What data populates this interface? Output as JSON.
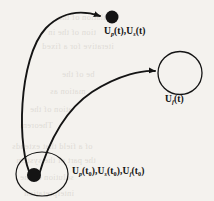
{
  "figure": {
    "caption_absent": true,
    "background_color": "#f4f2ee",
    "ink_color": "#141414",
    "media": "scanned-page"
  },
  "nodes": {
    "initial_state": {
      "name": "initial-state-ellipse",
      "shape": "ellipse",
      "filled_marker": true,
      "cx": 42,
      "cy": 174,
      "rx": 26,
      "ry": 22,
      "dot_cx": 34,
      "dot_cy": 175,
      "dot_r": 7
    },
    "final_state_top": {
      "name": "final-state-dot",
      "shape": "filled-dot",
      "cx": 112,
      "cy": 17,
      "r": 6.5
    },
    "final_state_right": {
      "name": "final-state-circle",
      "shape": "circle",
      "filled_marker": false,
      "cx": 180,
      "cy": 73,
      "rx": 22,
      "ry": 21.5
    }
  },
  "labels": {
    "top": {
      "name": "label-top",
      "text": "Up(t),Us(t)",
      "terms": [
        {
          "symbol": "U",
          "subscript": "p",
          "argument": "t"
        },
        {
          "symbol": "U",
          "subscript": "s",
          "argument": "t"
        }
      ]
    },
    "right": {
      "name": "label-right",
      "text": "Uf(t)",
      "terms": [
        {
          "symbol": "U",
          "subscript": "f",
          "argument": "t"
        }
      ]
    },
    "bottom": {
      "name": "label-bottom",
      "text": "Up(t0),Us(t0),Uf(t0)",
      "terms": [
        {
          "symbol": "U",
          "subscript": "p",
          "argument": "t0"
        },
        {
          "symbol": "U",
          "subscript": "s",
          "argument": "t0"
        },
        {
          "symbol": "U",
          "subscript": "f",
          "argument": "t0"
        }
      ]
    }
  },
  "arrows": [
    {
      "name": "trajectory-arrow-upper",
      "from": "initial-state-ellipse",
      "to": "final-state-dot",
      "path": "M 32 178 C 16 150, 18 58, 46 28 C 66 8, 88 12, 100 16",
      "arrowhead_at": {
        "x": 104,
        "y": 17
      }
    },
    {
      "name": "trajectory-arrow-lower",
      "from": "initial-state-ellipse",
      "to": "final-state-circle",
      "path": "M 38 178 C 46 150, 62 112, 92 92 C 120 74, 144 70, 155 71",
      "arrowhead_at": {
        "x": 159,
        "y": 71
      }
    }
  ],
  "ghost_text": {
    "note": "faint show-through text from reverse side of scanned page",
    "lines": [
      {
        "text": "ulation of the",
        "x": 58,
        "y": 12
      },
      {
        "text": "tion of the in",
        "x": 48,
        "y": 27
      },
      {
        "text": "iterative for a fixed",
        "x": 42,
        "y": 41
      },
      {
        "text": "be of the",
        "x": 62,
        "y": 69
      },
      {
        "text": "mation as",
        "x": 50,
        "y": 86
      },
      {
        "text": "ation of the",
        "x": 30,
        "y": 104
      },
      {
        "text": "Theorem",
        "x": 20,
        "y": 120
      },
      {
        "text": "of a field that extends",
        "x": 12,
        "y": 141
      },
      {
        "text": "the part of the system",
        "x": 16,
        "y": 155
      },
      {
        "text": "solution of the",
        "x": 20,
        "y": 172
      },
      {
        "text": "interpretation",
        "x": 24,
        "y": 188
      }
    ]
  }
}
